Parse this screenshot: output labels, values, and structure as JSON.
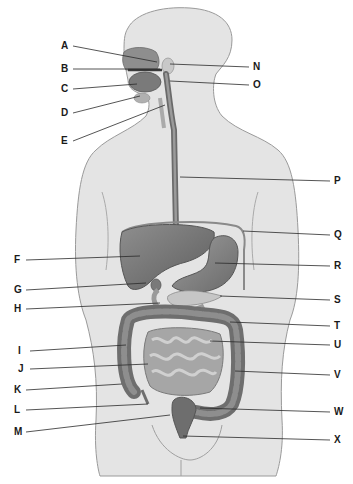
{
  "diagram": {
    "colors": {
      "background": "#ffffff",
      "body": "#e4e4e4",
      "body_outline": "#9a9a9a",
      "organ_dark": "#6e6e6e",
      "organ_mid": "#8c8c8c",
      "organ_light": "#b4b4b4",
      "leader_line": "#2a2a2a"
    },
    "labels_left": [
      {
        "id": "A",
        "x": 61,
        "y": 41,
        "tx": 157,
        "ty": 62
      },
      {
        "id": "B",
        "x": 61,
        "y": 64,
        "tx": 160,
        "ty": 69
      },
      {
        "id": "C",
        "x": 61,
        "y": 84,
        "tx": 137,
        "ty": 84
      },
      {
        "id": "D",
        "x": 61,
        "y": 108,
        "tx": 140,
        "ty": 96
      },
      {
        "id": "E",
        "x": 61,
        "y": 136,
        "tx": 165,
        "ty": 105
      },
      {
        "id": "F",
        "x": 14,
        "y": 255,
        "tx": 140,
        "ty": 256
      },
      {
        "id": "G",
        "x": 14,
        "y": 285,
        "tx": 146,
        "ty": 283
      },
      {
        "id": "H",
        "x": 14,
        "y": 304,
        "tx": 160,
        "ty": 303
      },
      {
        "id": "I",
        "x": 18,
        "y": 346,
        "tx": 126,
        "ty": 345
      },
      {
        "id": "J",
        "x": 18,
        "y": 364,
        "tx": 148,
        "ty": 364
      },
      {
        "id": "K",
        "x": 14,
        "y": 385,
        "tx": 122,
        "ty": 384
      },
      {
        "id": "L",
        "x": 14,
        "y": 405,
        "tx": 148,
        "ty": 404
      },
      {
        "id": "M",
        "x": 14,
        "y": 427,
        "tx": 170,
        "ty": 415
      }
    ],
    "labels_right": [
      {
        "id": "N",
        "x": 253,
        "y": 62,
        "tx": 170,
        "ty": 64
      },
      {
        "id": "O",
        "x": 253,
        "y": 80,
        "tx": 170,
        "ty": 81
      },
      {
        "id": "P",
        "x": 334,
        "y": 176,
        "tx": 180,
        "ty": 177
      },
      {
        "id": "Q",
        "x": 334,
        "y": 230,
        "tx": 243,
        "ty": 231
      },
      {
        "id": "R",
        "x": 334,
        "y": 261,
        "tx": 215,
        "ty": 263
      },
      {
        "id": "S",
        "x": 334,
        "y": 295,
        "tx": 220,
        "ty": 296
      },
      {
        "id": "T",
        "x": 334,
        "y": 321,
        "tx": 230,
        "ty": 322
      },
      {
        "id": "U",
        "x": 334,
        "y": 340,
        "tx": 210,
        "ty": 341
      },
      {
        "id": "V",
        "x": 334,
        "y": 370,
        "tx": 235,
        "ty": 371
      },
      {
        "id": "W",
        "x": 334,
        "y": 407,
        "tx": 200,
        "ty": 408
      },
      {
        "id": "X",
        "x": 334,
        "y": 435,
        "tx": 183,
        "ty": 436
      }
    ]
  }
}
